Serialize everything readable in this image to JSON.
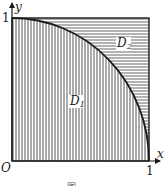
{
  "figure": {
    "axes": {
      "x_label": "x",
      "y_label": "y",
      "origin_label": "O",
      "x_tick": "1",
      "y_tick": "1"
    },
    "regions": [
      {
        "name": "D",
        "subscript": "1",
        "hatch": "vertical",
        "description": "region under quarter-circle arc"
      },
      {
        "name": "D",
        "subscript": "2",
        "hatch": "horizontal",
        "description": "region between arc and unit square"
      }
    ],
    "curve": "quarter circle x^2 + y^2 = 1, first quadrant",
    "caption": "图",
    "colors": {
      "stroke": "#1a1a1a",
      "hatch": "#555555",
      "background": "#ffffff"
    }
  }
}
